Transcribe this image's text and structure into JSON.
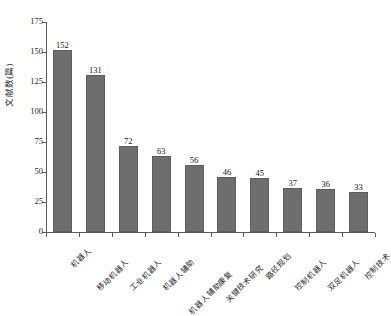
{
  "chart_data": {
    "type": "bar",
    "title": "",
    "xlabel": "",
    "ylabel": "文献数(篇)",
    "ylim": [
      0,
      175
    ],
    "yticks": [
      0,
      25,
      50,
      75,
      100,
      125,
      150,
      175
    ],
    "grid": false,
    "legend": false,
    "bar_color": "#6e6e6e",
    "categories": [
      "机器人",
      "移动机器人",
      "工业机器人",
      "机器人辅助",
      "机器人辅助康复",
      "关键技术研究",
      "路径规划",
      "控制机器人",
      "双足机器人",
      "控制技术"
    ],
    "values": [
      152,
      131,
      72,
      63,
      56,
      46,
      45,
      37,
      36,
      33
    ],
    "value_labels": [
      "152",
      "131",
      "72",
      "63",
      "56",
      "46",
      "45",
      "37",
      "36",
      "33"
    ]
  },
  "axis": {
    "ytick_labels": [
      "0",
      "25",
      "50",
      "75",
      "100",
      "125",
      "150",
      "175"
    ]
  }
}
